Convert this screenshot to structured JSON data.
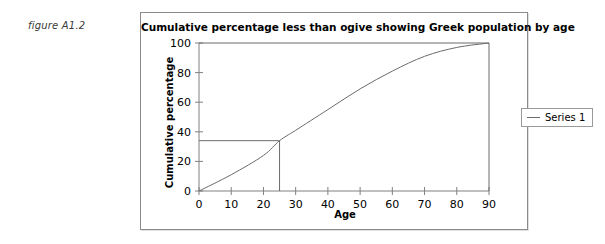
{
  "figure": {
    "caption": "figure A1.2"
  },
  "chart_data": {
    "type": "line",
    "title": "Cumulative percentage less than ogive showing Greek population by age",
    "xlabel": "Age",
    "ylabel": "Cumulative percentage",
    "xlim": [
      0,
      90
    ],
    "ylim": [
      0,
      100
    ],
    "xticks": [
      0,
      10,
      20,
      30,
      40,
      50,
      60,
      70,
      80,
      90
    ],
    "yticks": [
      0,
      20,
      40,
      60,
      80,
      100
    ],
    "grid": false,
    "legend_position": "right-outside",
    "series": [
      {
        "name": "Series 1",
        "x": [
          0,
          10,
          20,
          25,
          30,
          40,
          50,
          60,
          70,
          80,
          90
        ],
        "values": [
          0,
          11,
          24,
          34,
          41,
          55,
          69,
          81,
          91,
          97,
          100
        ]
      }
    ],
    "annotations": [
      {
        "name": "median-construction-lines",
        "type": "crosshair",
        "x": 25,
        "y": 34,
        "description": "horizontal line from y-axis to curve at 34% then vertical line down to age 25"
      },
      {
        "name": "upper-bound-line",
        "type": "horizontal",
        "y": 100
      },
      {
        "name": "right-bound-line",
        "type": "vertical",
        "x": 90
      }
    ],
    "colors": {
      "series_line": "#6b6b6b",
      "axis": "#808080",
      "panel_border": "#8b8b8b",
      "text": "#000000",
      "background": "#ffffff"
    }
  },
  "legend": {
    "entries": [
      {
        "label": "Series 1",
        "marker": "line-swatch"
      }
    ]
  }
}
